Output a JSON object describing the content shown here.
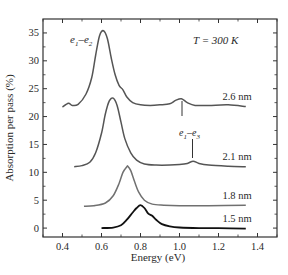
{
  "chart_data": {
    "type": "line",
    "title": "",
    "xlabel": "Energy (eV)",
    "ylabel": "Absorption per pass (%)",
    "xlim": [
      0.3,
      1.5
    ],
    "ylim": [
      -1.6,
      37.5
    ],
    "xticks": [
      0.4,
      0.6,
      0.8,
      1.0,
      1.2,
      1.4
    ],
    "xtick_labels": [
      "0.4",
      "0.6",
      "0.8",
      "1.0",
      "1.2",
      "1.4"
    ],
    "yticks": [
      0,
      5,
      10,
      15,
      20,
      25,
      30,
      35
    ],
    "ytick_labels": [
      "0",
      "5",
      "10",
      "15",
      "20",
      "25",
      "30",
      "35"
    ],
    "grid": false,
    "legend": "inline labels at right end of curves",
    "annotations": [
      {
        "text": "T = 300 K",
        "x": 1.18,
        "y": 33.7
      },
      {
        "text": "e1–e2",
        "x": 0.44,
        "y": 33.0,
        "note": "labels the main peak of the 2.6 nm curve"
      },
      {
        "text": "e1–e3",
        "x": 1.07,
        "y": 16.8,
        "note": "marker lines point to small peaks near 1.01 eV (2.6 nm) and 1.07 eV (2.1 nm)"
      }
    ],
    "series": [
      {
        "name": "2.6 nm",
        "color": "#555555",
        "x": [
          0.4,
          0.43,
          0.45,
          0.48,
          0.52,
          0.55,
          0.57,
          0.59,
          0.61,
          0.63,
          0.65,
          0.67,
          0.69,
          0.71,
          0.73,
          0.76,
          0.8,
          0.85,
          0.9,
          0.95,
          0.98,
          1.01,
          1.04,
          1.08,
          1.15,
          1.25,
          1.34
        ],
        "y": [
          21.7,
          22.4,
          22.0,
          22.2,
          24.0,
          27.0,
          31.0,
          34.5,
          35.4,
          34.0,
          30.5,
          27.5,
          25.6,
          24.8,
          23.5,
          22.5,
          22.1,
          22.0,
          22.1,
          22.3,
          22.9,
          23.2,
          22.5,
          22.0,
          22.0,
          22.1,
          21.8
        ]
      },
      {
        "name": "2.1 nm",
        "color": "#555555",
        "x": [
          0.46,
          0.5,
          0.54,
          0.57,
          0.6,
          0.62,
          0.64,
          0.66,
          0.68,
          0.7,
          0.72,
          0.75,
          0.78,
          0.82,
          0.88,
          0.95,
          1.0,
          1.04,
          1.07,
          1.1,
          1.15,
          1.25,
          1.34
        ],
        "y": [
          11.0,
          11.2,
          11.8,
          13.5,
          17.0,
          20.5,
          22.8,
          23.3,
          22.0,
          19.0,
          16.0,
          13.5,
          12.2,
          11.5,
          11.3,
          11.3,
          11.4,
          11.6,
          12.0,
          11.6,
          11.3,
          11.1,
          11.0
        ]
      },
      {
        "name": "1.8 nm",
        "color": "#707070",
        "x": [
          0.51,
          0.56,
          0.62,
          0.66,
          0.69,
          0.71,
          0.73,
          0.735,
          0.75,
          0.77,
          0.79,
          0.82,
          0.86,
          0.92,
          1.0,
          1.15,
          1.34
        ],
        "y": [
          3.9,
          4.0,
          4.5,
          5.8,
          8.0,
          10.0,
          11.0,
          11.1,
          10.3,
          8.3,
          6.5,
          5.0,
          4.3,
          4.1,
          4.0,
          4.0,
          4.1
        ]
      },
      {
        "name": "1.5 nm",
        "color": "#111111",
        "x": [
          0.6,
          0.66,
          0.7,
          0.73,
          0.76,
          0.78,
          0.8,
          0.82,
          0.84,
          0.86,
          0.88,
          0.91,
          0.95,
          1.0,
          1.1,
          1.2,
          1.34
        ],
        "y": [
          0.0,
          0.1,
          0.5,
          1.5,
          2.8,
          3.6,
          4.1,
          3.6,
          2.6,
          2.2,
          1.5,
          0.7,
          0.3,
          0.1,
          0.0,
          0.0,
          -0.1
        ]
      }
    ],
    "curve_labels": [
      {
        "text": "2.6 nm",
        "x": 1.22,
        "y": 23.0
      },
      {
        "text": "2.1 nm",
        "x": 1.22,
        "y": 12.3
      },
      {
        "text": "1.8 nm",
        "x": 1.22,
        "y": 5.2
      },
      {
        "text": "1.5 nm",
        "x": 1.22,
        "y": 1.1
      }
    ]
  },
  "labels": {
    "temperature": "T = 300 K",
    "e12_base": "e",
    "e12_sub1": "1",
    "e12_dash": "–e",
    "e12_sub2": "2",
    "e13_base": "e",
    "e13_sub1": "1",
    "e13_dash": "–e",
    "e13_sub2": "3"
  }
}
